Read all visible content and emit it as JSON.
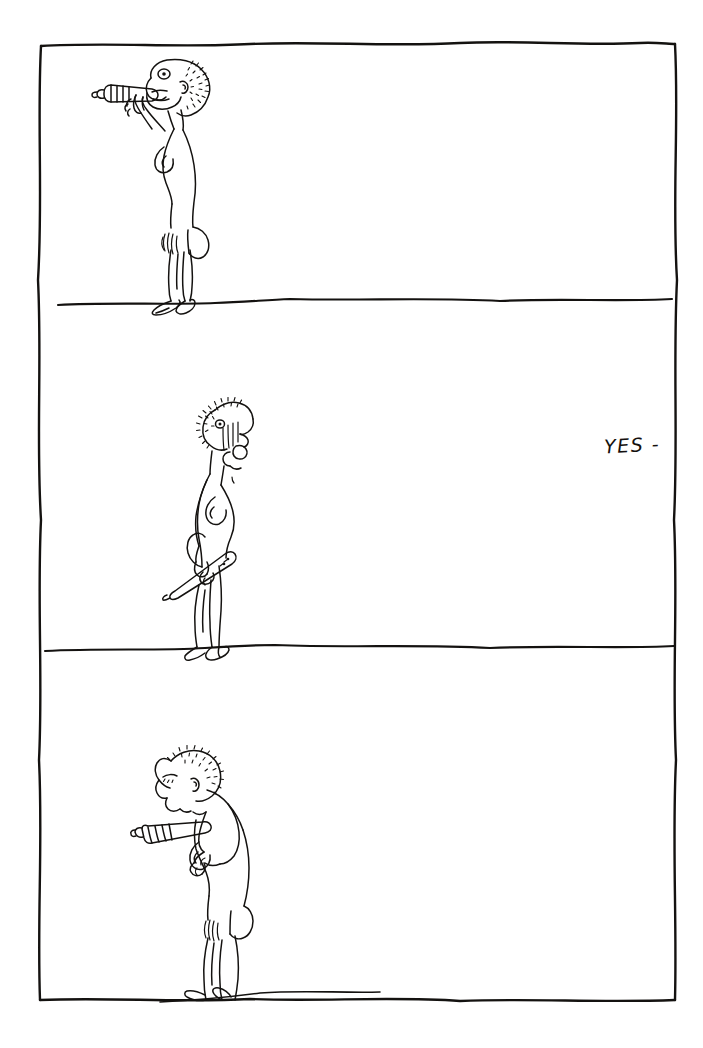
{
  "artwork": {
    "medium": "pen-and-ink line drawing on white paper",
    "background_color": "#ffffff",
    "ink_color": "#141210",
    "frame": {
      "style": "hand-drawn wobbly rectangle",
      "left": 40,
      "top": 44,
      "right": 676,
      "bottom": 1001
    },
    "panel_dividers_y": [
      303,
      648
    ]
  },
  "annotations": {
    "yes_note": "YES -"
  },
  "panels": [
    {
      "index": 1,
      "name": "panel-top",
      "ground_line_y": 303,
      "figure": {
        "name": "figure-blowing-flute",
        "description": "thin nude standing figure facing left, holding a short ridged tube to its mouth with both hands raised",
        "facing": "left",
        "object_held": "ridged tube / flute",
        "object_position": "at mouth, held horizontally with both hands"
      }
    },
    {
      "index": 2,
      "name": "panel-middle",
      "ground_line_y": 648,
      "figure": {
        "name": "figure-lowered-flute",
        "description": "thin nude standing figure facing right with open mouth, arms down, holding a long ridged tube diagonally at hip level",
        "facing": "right",
        "object_held": "ridged tube / flute",
        "object_position": "lowered, held diagonally across hips"
      }
    },
    {
      "index": 3,
      "name": "panel-bottom",
      "ground_line_y": 1001,
      "figure": {
        "name": "figure-raising-flute",
        "description": "thin nude standing figure facing left, bent slightly forward, raising the ridged tube toward the chest with both hands",
        "facing": "left",
        "object_held": "ridged tube / flute",
        "object_position": "raised to chest height, held with both hands"
      }
    }
  ]
}
